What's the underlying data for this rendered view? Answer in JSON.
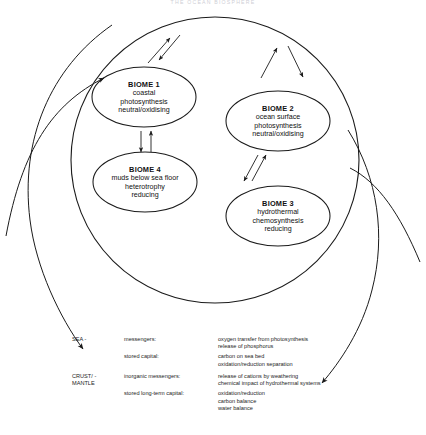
{
  "page": {
    "title_faint": "THE OCEAN BIOSPHERE"
  },
  "diagram": {
    "outer_system_name": "ocean-system-boundary",
    "biomes": [
      {
        "id": "biome-1",
        "title": "BIOME 1",
        "lines": [
          "coastal",
          "photosynthesis",
          "neutral/oxidising"
        ],
        "cx": 144,
        "cy": 97,
        "rx": 52,
        "ry": 30
      },
      {
        "id": "biome-2",
        "title": "BIOME 2",
        "lines": [
          "ocean surface",
          "photosynthesis",
          "neutral/oxidising"
        ],
        "cx": 278,
        "cy": 121,
        "rx": 52,
        "ry": 30
      },
      {
        "id": "biome-4",
        "title": "BIOME 4",
        "lines": [
          "muds below sea floor",
          "heterotrophy",
          "reducing"
        ],
        "cx": 145,
        "cy": 182,
        "rx": 52,
        "ry": 30
      },
      {
        "id": "biome-3",
        "title": "BIOME 3",
        "lines": [
          "hydrothermal",
          "chemosynthesis",
          "reducing"
        ],
        "cx": 278,
        "cy": 216,
        "rx": 52,
        "ry": 30
      }
    ],
    "exchange_arrows": [
      {
        "name": "arrow-pair-top-left",
        "desc": "two-way exchange above biome 1"
      },
      {
        "name": "arrow-pair-top-right",
        "desc": "two-way exchange above biome 2"
      },
      {
        "name": "arrow-pair-biome1-biome4",
        "desc": "two-way vertical exchange"
      },
      {
        "name": "arrow-pair-biome2-biome3",
        "desc": "two-way diagonal exchange"
      }
    ],
    "external_arcs": [
      {
        "name": "arc-sea-inflow",
        "desc": "left arc entering system, arrowhead up-right"
      },
      {
        "name": "arc-sea-outflow",
        "desc": "left arc leaving system, arrowhead down"
      },
      {
        "name": "arc-crust-inflow",
        "desc": "right arc entering system"
      },
      {
        "name": "arc-crust-outflow",
        "desc": "right arc leaving system, arrowhead down-left"
      }
    ]
  },
  "legend": {
    "rows": [
      {
        "reservoir": "SEA -",
        "groups": [
          {
            "category": "messengers:",
            "items": [
              "oxygen transfer from photosynthesis",
              "release of phosphorus"
            ]
          },
          {
            "category": "stored capital:",
            "items": [
              "carbon on sea bed",
              "oxidation/reduction separation"
            ]
          }
        ]
      },
      {
        "reservoir": "CRUST/ -",
        "reservoir_line2": "MANTLE",
        "groups": [
          {
            "category": "inorganic messengers:",
            "items": [
              "release of cations by weathering",
              "chemical impact of hydrothermal systems"
            ]
          },
          {
            "category": "stored long-term capital:",
            "items": [
              "oxidation/reduction",
              "carbon balance",
              "water balance"
            ]
          }
        ]
      }
    ]
  },
  "colors": {
    "ink": "#1b1b1b",
    "paper": "#ffffff",
    "faint": "#cfcfd6"
  }
}
